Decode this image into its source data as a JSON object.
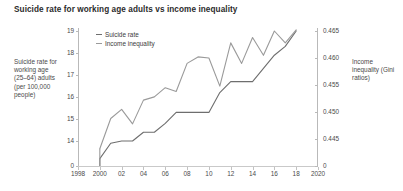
{
  "title": "Suicide rate for working age adults vs income inequality",
  "left_axis_caption": "Suicide rate for working age (25–64) adults (per 100,000 people)",
  "right_axis_caption": "Income inequality (Gini ratios)",
  "legend": {
    "position": "top-left-inside",
    "items": [
      {
        "label": "Suicide rate",
        "color": "#6e6e6e"
      },
      {
        "label": "Income inequality",
        "color": "#9a9a9a"
      }
    ]
  },
  "colors": {
    "suicide_rate": "#6e6e6e",
    "income_inequality": "#9a9a9a",
    "axis": "#b9b9b9",
    "text": "#3c3c3c",
    "background": "#ffffff"
  },
  "chart_data": {
    "type": "line",
    "title": "Suicide rate for working age adults vs income inequality",
    "xlabel": "",
    "ylabel": "Suicide rate for working age (25–64) adults (per 100,000 people)",
    "y2label": "Income inequality (Gini ratios)",
    "grid": false,
    "legend_position": "top-left",
    "xlim": [
      1998,
      2020
    ],
    "ylim": [
      13,
      19
    ],
    "y2lim": [
      0.4425,
      0.4665
    ],
    "x_tick_labels": [
      "1998",
      "2000",
      "02",
      "04",
      "06",
      "08",
      "10",
      "12",
      "14",
      "16",
      "18",
      "2020"
    ],
    "x_tick_values": [
      1998,
      2000,
      2002,
      2004,
      2006,
      2008,
      2010,
      2012,
      2014,
      2016,
      2018,
      2020
    ],
    "y_tick_labels": [
      "0",
      "14",
      "15",
      "16",
      "17",
      "18",
      "19"
    ],
    "y_tick_values": [
      13,
      14,
      15,
      16,
      17,
      18,
      19
    ],
    "y2_tick_labels": [
      "0",
      "0.445",
      "0.450",
      "0.455",
      "0.460",
      "0.465"
    ],
    "y2_tick_values": [
      0.4425,
      0.445,
      0.45,
      0.455,
      0.46,
      0.465
    ],
    "x": [
      2000,
      2001,
      2002,
      2003,
      2004,
      2005,
      2006,
      2007,
      2008,
      2009,
      2010,
      2011,
      2012,
      2013,
      2014,
      2015,
      2016,
      2017,
      2018
    ],
    "series": [
      {
        "name": "Suicide rate",
        "axis": "left",
        "color": "#6e6e6e",
        "values": [
          13.2,
          13.9,
          14.0,
          14.0,
          14.4,
          14.4,
          14.8,
          15.3,
          15.3,
          15.3,
          15.3,
          16.2,
          16.7,
          16.7,
          16.7,
          17.3,
          17.9,
          18.3,
          19.0
        ]
      },
      {
        "name": "Income inequality",
        "axis": "right",
        "color": "#9a9a9a",
        "values": [
          0.4432,
          0.4488,
          0.4505,
          0.4478,
          0.4522,
          0.4528,
          0.4545,
          0.4538,
          0.459,
          0.4602,
          0.46,
          0.4548,
          0.4628,
          0.459,
          0.4638,
          0.4605,
          0.465,
          0.4628,
          0.4652
        ]
      }
    ]
  }
}
